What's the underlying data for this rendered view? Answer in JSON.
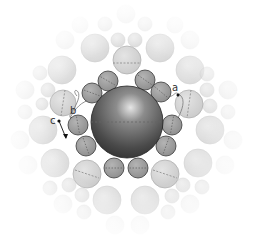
{
  "diagram": {
    "central_sphere": {
      "cx": 127,
      "cy": 122,
      "r": 36,
      "equator_dashed": true
    },
    "first_shell": [
      {
        "cx": 108,
        "cy": 81,
        "r": 10,
        "dash_angle": 30
      },
      {
        "cx": 92,
        "cy": 93,
        "r": 10,
        "dash_angle": 20
      },
      {
        "cx": 145,
        "cy": 80,
        "r": 10,
        "dash_angle": 35
      },
      {
        "cx": 161,
        "cy": 92,
        "r": 10,
        "dash_angle": 40
      },
      {
        "cx": 78,
        "cy": 125,
        "r": 10,
        "dash_angle": 80
      },
      {
        "cx": 86,
        "cy": 146,
        "r": 10,
        "dash_angle": 70
      },
      {
        "cx": 172,
        "cy": 125,
        "r": 10,
        "dash_angle": 100
      },
      {
        "cx": 166,
        "cy": 146,
        "r": 10,
        "dash_angle": 110
      },
      {
        "cx": 114,
        "cy": 168,
        "r": 10,
        "dash_angle": 0
      },
      {
        "cx": 138,
        "cy": 168,
        "r": 10,
        "dash_angle": 0
      }
    ],
    "highlighted_second_shell": [
      {
        "cx": 127,
        "cy": 60,
        "r": 14,
        "dash": "horizontal"
      },
      {
        "cx": 63,
        "cy": 103,
        "r": 13,
        "dash": "vertical"
      },
      {
        "cx": 189,
        "cy": 104,
        "r": 14,
        "dash": "vertical"
      },
      {
        "cx": 87,
        "cy": 174,
        "r": 14,
        "dash": "diagonal"
      },
      {
        "cx": 165,
        "cy": 174,
        "r": 14,
        "dash": "diagonal"
      }
    ],
    "background_spheres": [
      {
        "cx": 95,
        "cy": 48,
        "r": 14,
        "o": 0.75
      },
      {
        "cx": 160,
        "cy": 48,
        "r": 14,
        "o": 0.75
      },
      {
        "cx": 118,
        "cy": 40,
        "r": 7,
        "o": 0.7
      },
      {
        "cx": 135,
        "cy": 40,
        "r": 7,
        "o": 0.7
      },
      {
        "cx": 105,
        "cy": 24,
        "r": 7,
        "o": 0.4
      },
      {
        "cx": 145,
        "cy": 24,
        "r": 7,
        "o": 0.4
      },
      {
        "cx": 126,
        "cy": 14,
        "r": 9,
        "o": 0.3
      },
      {
        "cx": 62,
        "cy": 70,
        "r": 14,
        "o": 0.7
      },
      {
        "cx": 190,
        "cy": 70,
        "r": 14,
        "o": 0.7
      },
      {
        "cx": 40,
        "cy": 73,
        "r": 7,
        "o": 0.5
      },
      {
        "cx": 48,
        "cy": 90,
        "r": 7,
        "o": 0.6
      },
      {
        "cx": 207,
        "cy": 74,
        "r": 7,
        "o": 0.5
      },
      {
        "cx": 207,
        "cy": 90,
        "r": 7,
        "o": 0.6
      },
      {
        "cx": 42,
        "cy": 104,
        "r": 6,
        "o": 0.6
      },
      {
        "cx": 210,
        "cy": 106,
        "r": 7,
        "o": 0.6
      },
      {
        "cx": 25,
        "cy": 90,
        "r": 9,
        "o": 0.4
      },
      {
        "cx": 228,
        "cy": 90,
        "r": 9,
        "o": 0.4
      },
      {
        "cx": 25,
        "cy": 112,
        "r": 7,
        "o": 0.4
      },
      {
        "cx": 228,
        "cy": 112,
        "r": 7,
        "o": 0.4
      },
      {
        "cx": 43,
        "cy": 130,
        "r": 14,
        "o": 0.7
      },
      {
        "cx": 210,
        "cy": 130,
        "r": 14,
        "o": 0.7
      },
      {
        "cx": 55,
        "cy": 163,
        "r": 14,
        "o": 0.7
      },
      {
        "cx": 198,
        "cy": 163,
        "r": 14,
        "o": 0.7
      },
      {
        "cx": 50,
        "cy": 188,
        "r": 7,
        "o": 0.6
      },
      {
        "cx": 69,
        "cy": 185,
        "r": 7,
        "o": 0.6
      },
      {
        "cx": 82,
        "cy": 195,
        "r": 7,
        "o": 0.6
      },
      {
        "cx": 183,
        "cy": 185,
        "r": 7,
        "o": 0.6
      },
      {
        "cx": 202,
        "cy": 187,
        "r": 7,
        "o": 0.6
      },
      {
        "cx": 172,
        "cy": 196,
        "r": 7,
        "o": 0.6
      },
      {
        "cx": 107,
        "cy": 200,
        "r": 14,
        "o": 0.7
      },
      {
        "cx": 145,
        "cy": 200,
        "r": 14,
        "o": 0.7
      },
      {
        "cx": 84,
        "cy": 212,
        "r": 7,
        "o": 0.5
      },
      {
        "cx": 168,
        "cy": 212,
        "r": 7,
        "o": 0.5
      },
      {
        "cx": 63,
        "cy": 204,
        "r": 9,
        "o": 0.35
      },
      {
        "cx": 190,
        "cy": 204,
        "r": 9,
        "o": 0.35
      },
      {
        "cx": 20,
        "cy": 140,
        "r": 9,
        "o": 0.3
      },
      {
        "cx": 233,
        "cy": 140,
        "r": 9,
        "o": 0.3
      },
      {
        "cx": 28,
        "cy": 165,
        "r": 9,
        "o": 0.25
      },
      {
        "cx": 225,
        "cy": 165,
        "r": 9,
        "o": 0.25
      },
      {
        "cx": 115,
        "cy": 225,
        "r": 9,
        "o": 0.25
      },
      {
        "cx": 140,
        "cy": 225,
        "r": 9,
        "o": 0.25
      },
      {
        "cx": 65,
        "cy": 40,
        "r": 9,
        "o": 0.3
      },
      {
        "cx": 190,
        "cy": 40,
        "r": 9,
        "o": 0.3
      },
      {
        "cx": 80,
        "cy": 25,
        "r": 8,
        "o": 0.25
      },
      {
        "cx": 175,
        "cy": 25,
        "r": 8,
        "o": 0.25
      }
    ],
    "labels": {
      "a": "a",
      "b": "b",
      "c": "c"
    },
    "colors": {
      "central_dark": "#2e2e2e",
      "central_light": "#c8c8c8",
      "first_shell_fill": "#9a9a9a",
      "second_shell_fill": "#d8d8d8",
      "outline": "#555555"
    }
  }
}
